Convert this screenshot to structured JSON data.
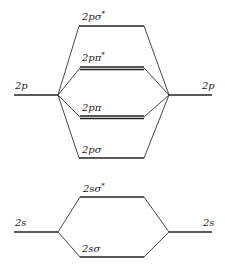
{
  "diagram": {
    "colors": {
      "line": "#222222",
      "background": "#ffffff"
    },
    "atomic_orbitals": {
      "left_2p": {
        "label": "2p"
      },
      "right_2p": {
        "label": "2p"
      },
      "left_2s": {
        "label": "2s"
      },
      "right_2s": {
        "label": "2s"
      }
    },
    "molecular_orbitals": [
      {
        "id": "2p_sigma_star",
        "label_main": "2pσ",
        "label_sup": "*",
        "degenerate": false
      },
      {
        "id": "2p_pi_star",
        "label_main": "2pπ",
        "label_sup": "*",
        "degenerate": true
      },
      {
        "id": "2p_pi",
        "label_main": "2pπ",
        "label_sup": "",
        "degenerate": true
      },
      {
        "id": "2p_sigma",
        "label_main": "2pσ",
        "label_sup": "",
        "degenerate": false
      },
      {
        "id": "2s_sigma_star",
        "label_main": "2sσ",
        "label_sup": "*",
        "degenerate": false
      },
      {
        "id": "2s_sigma",
        "label_main": "2sσ",
        "label_sup": "",
        "degenerate": false
      }
    ]
  }
}
